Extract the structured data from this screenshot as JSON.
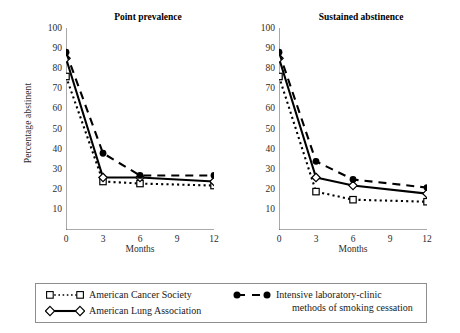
{
  "figure": {
    "ylabel": "Percentage abstinent",
    "xlabel": "Months"
  },
  "panels": [
    {
      "title": "Point prevalence"
    },
    {
      "title": "Sustained abstinence"
    }
  ],
  "legend": {
    "entries": [
      {
        "marker": "open-square-dotted",
        "label": "American Cancer Society",
        "label2": ""
      },
      {
        "marker": "open-diamond-solid",
        "label": "American Lung Association",
        "label2": ""
      },
      {
        "marker": "filled-circle-dashed",
        "label": "Intensive laboratory-clinic",
        "label2": "methods of smoking cessation"
      }
    ]
  },
  "chart_data": [
    {
      "type": "line",
      "title": "Point prevalence",
      "xlabel": "Months",
      "ylabel": "Percentage abstinent",
      "x": [
        0,
        3,
        6,
        12
      ],
      "xticks": [
        0,
        3,
        6,
        9,
        12
      ],
      "yticks": [
        10,
        20,
        30,
        40,
        50,
        60,
        70,
        80,
        90,
        100
      ],
      "xlim": [
        0,
        12
      ],
      "ylim": [
        0,
        100
      ],
      "grid": false,
      "legend_position": "bottom-outside",
      "series": [
        {
          "name": "American Cancer Society",
          "marker": "open-square",
          "line": "dotted",
          "values": [
            76,
            24,
            23,
            22
          ]
        },
        {
          "name": "American Lung Association",
          "marker": "open-diamond",
          "line": "solid",
          "values": [
            85,
            26,
            26,
            24
          ]
        },
        {
          "name": "Intensive laboratory-clinic methods of smoking cessation",
          "marker": "filled-circle",
          "line": "dashed",
          "values": [
            88,
            38,
            27,
            27
          ]
        }
      ]
    },
    {
      "type": "line",
      "title": "Sustained abstinence",
      "xlabel": "Months",
      "ylabel": "Percentage abstinent",
      "x": [
        0,
        3,
        6,
        12
      ],
      "xticks": [
        0,
        3,
        6,
        9,
        12
      ],
      "yticks": [
        10,
        20,
        30,
        40,
        50,
        60,
        70,
        80,
        90,
        100
      ],
      "xlim": [
        0,
        12
      ],
      "ylim": [
        0,
        100
      ],
      "grid": false,
      "legend_position": "bottom-outside",
      "series": [
        {
          "name": "American Cancer Society",
          "marker": "open-square",
          "line": "dotted",
          "values": [
            76,
            19,
            15,
            14
          ]
        },
        {
          "name": "American Lung Association",
          "marker": "open-diamond",
          "line": "solid",
          "values": [
            85,
            26,
            22,
            18
          ]
        },
        {
          "name": "Intensive laboratory-clinic methods of smoking cessation",
          "marker": "filled-circle",
          "line": "dashed",
          "values": [
            88,
            34,
            25,
            21
          ]
        }
      ]
    }
  ]
}
